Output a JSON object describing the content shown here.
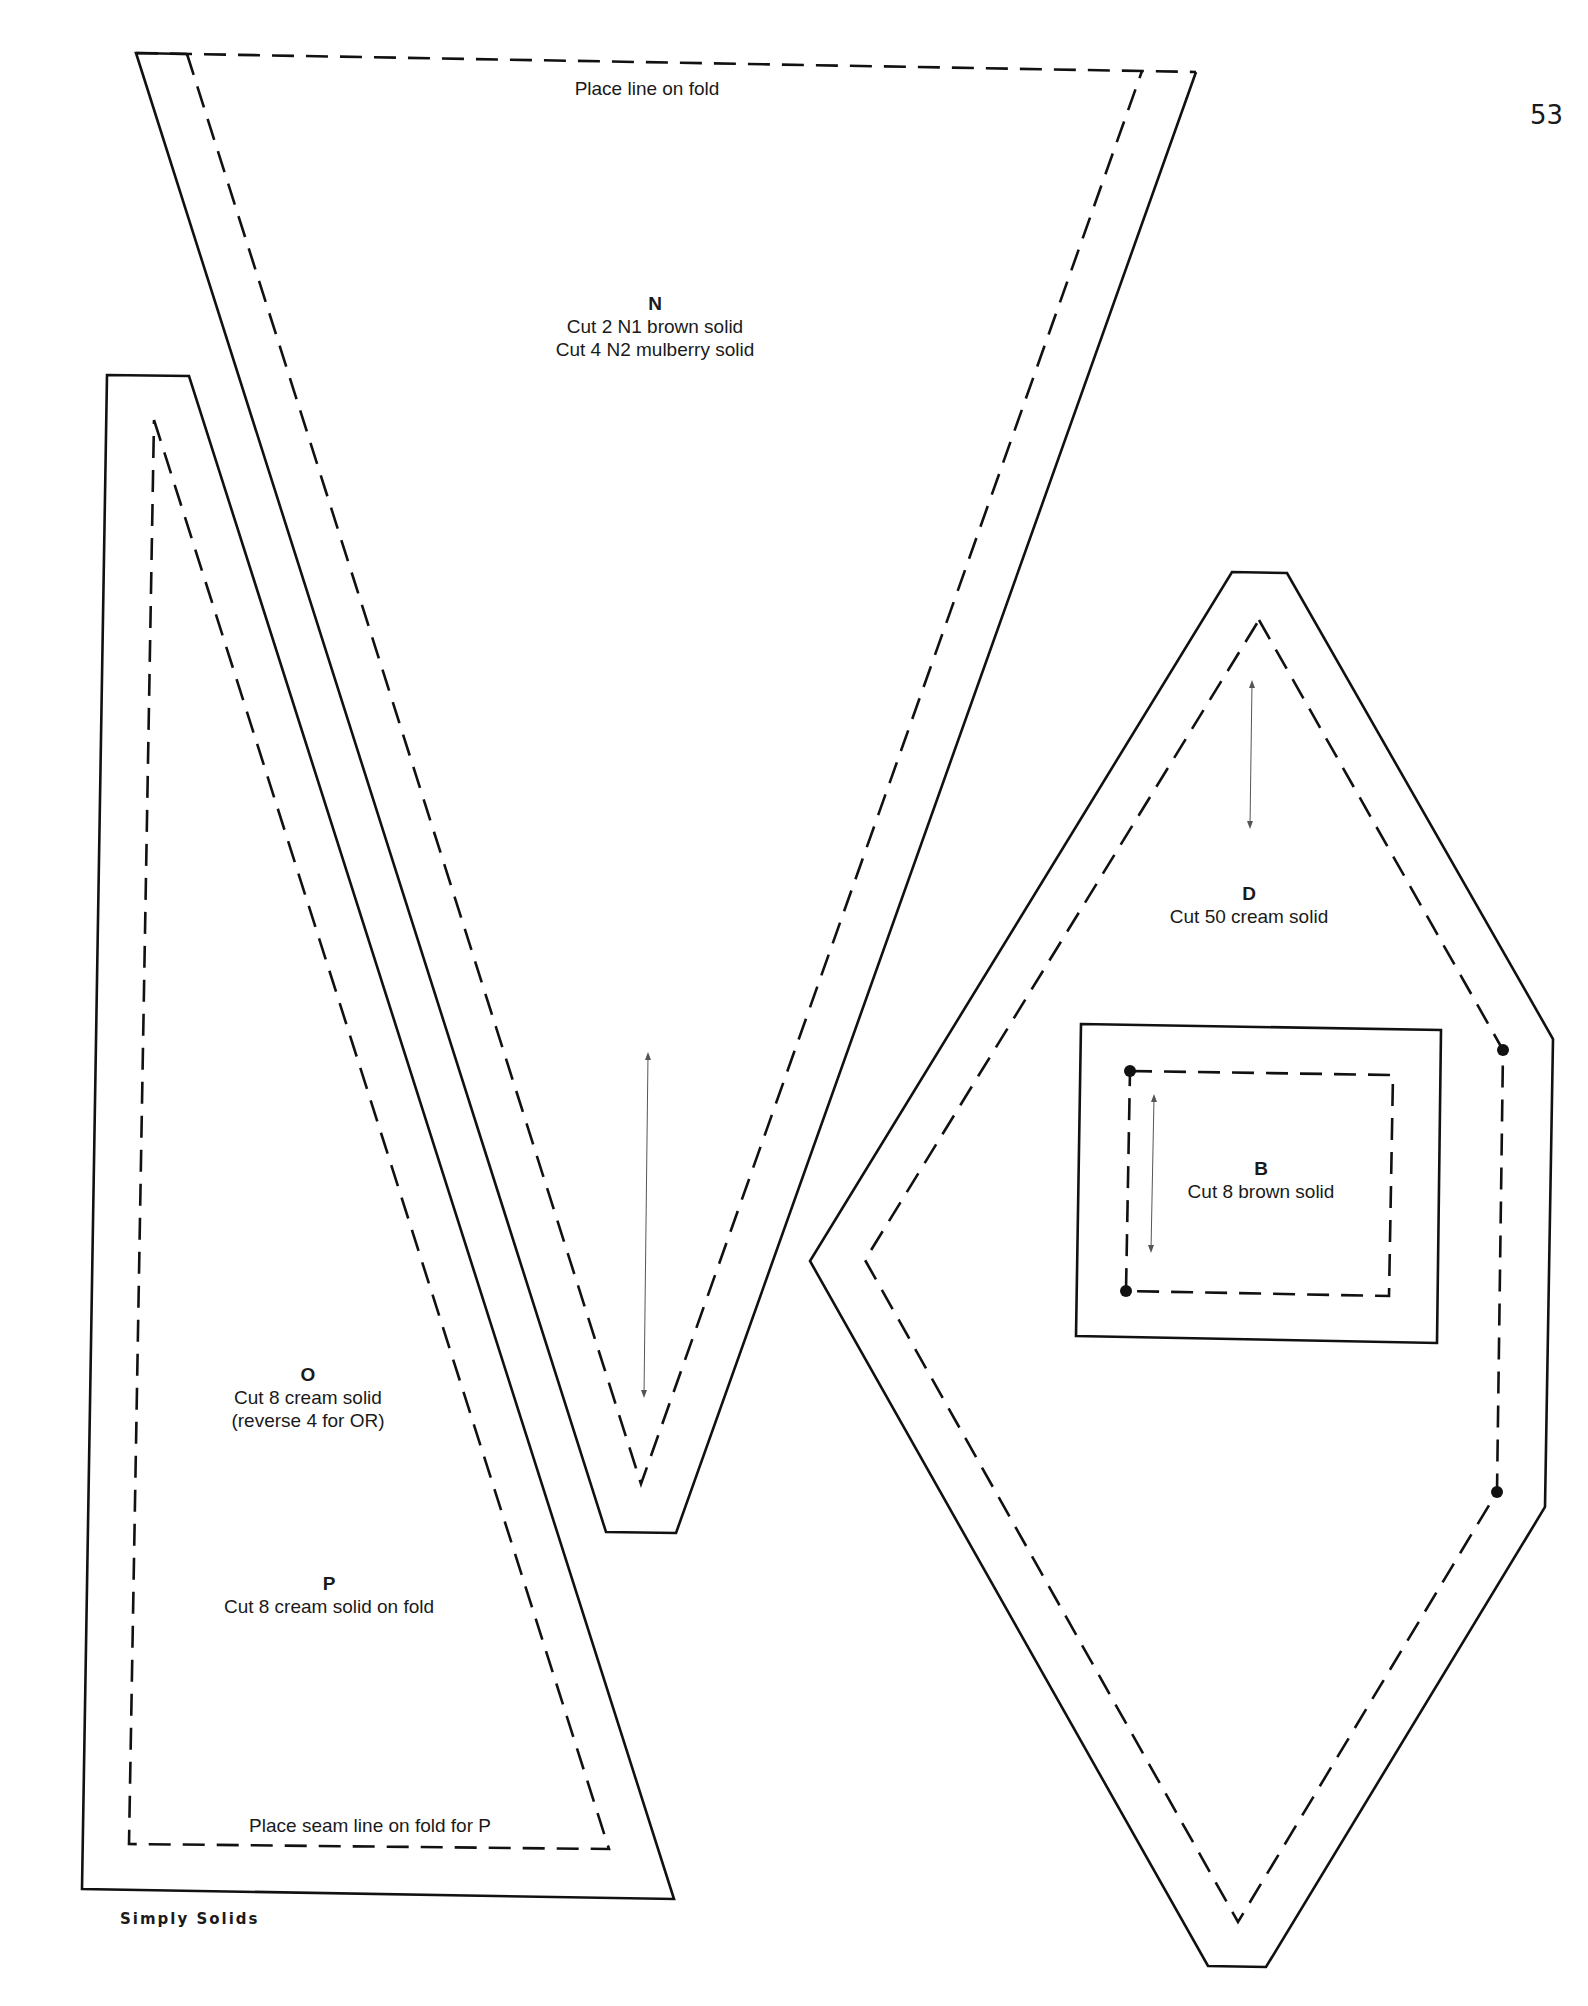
{
  "page": {
    "number": "53",
    "footer": "Simply Solids"
  },
  "pieces": {
    "N": {
      "letter": "N",
      "lines": [
        "Cut 2 N1 brown solid",
        "Cut 4 N2 mulberry solid"
      ],
      "fold_note": "Place line on fold"
    },
    "O": {
      "letter": "O",
      "lines": [
        "Cut 8 cream solid",
        "(reverse 4 for OR)"
      ]
    },
    "P": {
      "letter": "P",
      "lines": [
        "Cut 8 cream solid on fold"
      ],
      "fold_note": "Place seam line on fold for P"
    },
    "D": {
      "letter": "D",
      "lines": [
        "Cut 50 cream solid"
      ]
    },
    "B": {
      "letter": "B",
      "lines": [
        "Cut 8 brown solid"
      ]
    }
  },
  "colors": {
    "line": "#111111",
    "paper": "#ffffff"
  }
}
